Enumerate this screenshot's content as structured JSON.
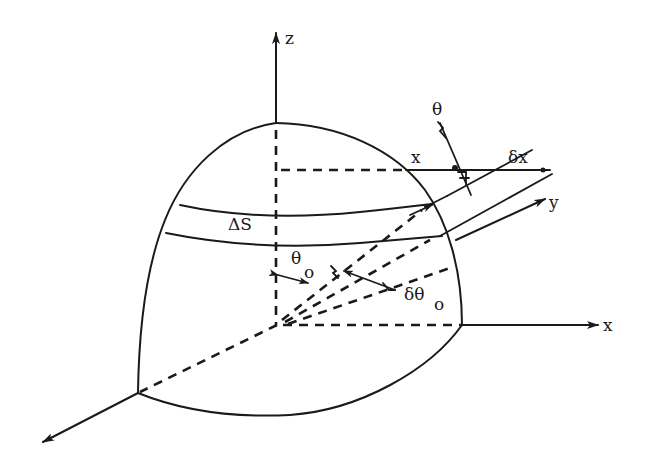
{
  "figure": {
    "type": "technical-diagram",
    "labels": {
      "z_axis": "z",
      "x_axis": "x",
      "y_axis": "y",
      "band": "ΔS",
      "theta_top": "θ",
      "x_distance": "x",
      "delta_x": "δx",
      "theta0": "θ",
      "theta0_sub": "o",
      "delta_theta0": "δθ",
      "delta_theta0_sub": "o"
    },
    "colors": {
      "ink": "#1a1a1a",
      "background": "#ffffff"
    }
  }
}
